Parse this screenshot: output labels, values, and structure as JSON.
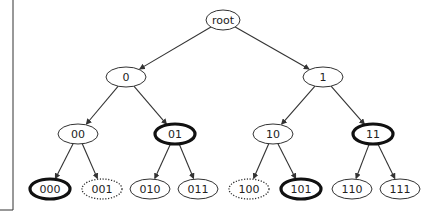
{
  "diagram": {
    "type": "binary-tree",
    "colors": {
      "stroke": "#333333",
      "text": "#222222",
      "background": "#ffffff"
    },
    "nodes": [
      {
        "id": "root",
        "label": "root",
        "x": 223,
        "y": 20,
        "rx": 17,
        "ry": 10,
        "style": "normal"
      },
      {
        "id": "0",
        "label": "0",
        "x": 126,
        "y": 77,
        "rx": 20,
        "ry": 10,
        "style": "normal"
      },
      {
        "id": "1",
        "label": "1",
        "x": 323,
        "y": 77,
        "rx": 20,
        "ry": 10,
        "style": "normal"
      },
      {
        "id": "00",
        "label": "00",
        "x": 78,
        "y": 134,
        "rx": 20,
        "ry": 10,
        "style": "normal"
      },
      {
        "id": "01",
        "label": "01",
        "x": 175,
        "y": 134,
        "rx": 20,
        "ry": 10,
        "style": "bold"
      },
      {
        "id": "10",
        "label": "10",
        "x": 273,
        "y": 134,
        "rx": 20,
        "ry": 10,
        "style": "normal"
      },
      {
        "id": "11",
        "label": "11",
        "x": 373,
        "y": 134,
        "rx": 20,
        "ry": 10,
        "style": "bold"
      },
      {
        "id": "000",
        "label": "000",
        "x": 50,
        "y": 189,
        "rx": 20,
        "ry": 10,
        "style": "bold"
      },
      {
        "id": "001",
        "label": "001",
        "x": 102,
        "y": 189,
        "rx": 20,
        "ry": 10,
        "style": "dotted"
      },
      {
        "id": "010",
        "label": "010",
        "x": 150,
        "y": 189,
        "rx": 20,
        "ry": 10,
        "style": "normal"
      },
      {
        "id": "011",
        "label": "011",
        "x": 198,
        "y": 189,
        "rx": 20,
        "ry": 10,
        "style": "normal"
      },
      {
        "id": "100",
        "label": "100",
        "x": 249,
        "y": 189,
        "rx": 20,
        "ry": 10,
        "style": "dotted"
      },
      {
        "id": "101",
        "label": "101",
        "x": 301,
        "y": 189,
        "rx": 20,
        "ry": 10,
        "style": "bold"
      },
      {
        "id": "110",
        "label": "110",
        "x": 352,
        "y": 189,
        "rx": 20,
        "ry": 10,
        "style": "normal"
      },
      {
        "id": "111",
        "label": "111",
        "x": 400,
        "y": 189,
        "rx": 20,
        "ry": 10,
        "style": "normal"
      }
    ],
    "edges": [
      [
        "root",
        "0"
      ],
      [
        "root",
        "1"
      ],
      [
        "0",
        "00"
      ],
      [
        "0",
        "01"
      ],
      [
        "1",
        "10"
      ],
      [
        "1",
        "11"
      ],
      [
        "00",
        "000"
      ],
      [
        "00",
        "001"
      ],
      [
        "01",
        "010"
      ],
      [
        "01",
        "011"
      ],
      [
        "10",
        "100"
      ],
      [
        "10",
        "101"
      ],
      [
        "11",
        "110"
      ],
      [
        "11",
        "111"
      ]
    ]
  }
}
